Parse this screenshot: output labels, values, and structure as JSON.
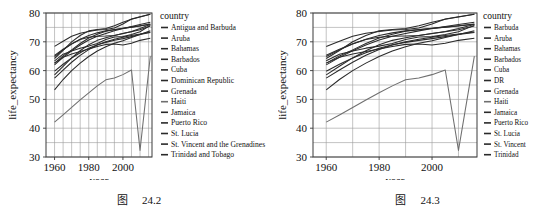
{
  "page": {
    "background": "#ffffff",
    "line_color": "#2a2a2a",
    "haiti_color": "#6f6f6f",
    "grid_color": "#9a9a9a"
  },
  "figures": [
    {
      "id": "figure-24-2",
      "caption_prefix": "图",
      "caption_number": "24.2",
      "legend_title": "country",
      "chart_data": {
        "type": "line",
        "title": "",
        "xlabel": "year",
        "ylabel": "life_expectancy",
        "xlim": [
          1955,
          2017
        ],
        "ylim": [
          30,
          80
        ],
        "xticks": [
          1960,
          1980,
          2000
        ],
        "yticks": [
          30,
          40,
          50,
          60,
          70,
          80
        ],
        "grid": true,
        "legend_position": "right",
        "x": [
          1960,
          1965,
          1970,
          1975,
          1980,
          1985,
          1990,
          1995,
          2000,
          2005,
          2010,
          2016
        ],
        "series": [
          {
            "name": "Antigua and Barbuda",
            "values": [
              62.0,
              64.6,
              66.9,
              68.9,
              70.6,
              71.9,
              72.9,
              73.8,
              74.6,
              75.3,
              76.0,
              76.8
            ]
          },
          {
            "name": "Aruba",
            "values": [
              64.9,
              67.2,
              69.2,
              70.9,
              72.2,
              73.1,
              73.8,
              74.3,
              74.7,
              75.1,
              75.5,
              76.1
            ]
          },
          {
            "name": "Bahamas",
            "values": [
              63.4,
              65.7,
              66.8,
              67.8,
              68.5,
              69.4,
              70.8,
              71.7,
              71.8,
              72.5,
              73.5,
              75.7
            ]
          },
          {
            "name": "Barbados",
            "values": [
              62.6,
              65.1,
              67.2,
              69.4,
              71.3,
              72.6,
              73.7,
              74.2,
              74.6,
              75.1,
              75.6,
              76.2
            ]
          },
          {
            "name": "Cuba",
            "values": [
              64.2,
              67.0,
              70.0,
              72.2,
              73.8,
              74.3,
              74.6,
              75.6,
              76.8,
              77.8,
              78.6,
              79.6
            ]
          },
          {
            "name": "Dominican Republic",
            "values": [
              53.3,
              56.9,
              60.0,
              62.6,
              64.9,
              66.8,
              68.3,
              69.5,
              70.4,
              71.5,
              72.5,
              73.8
            ]
          },
          {
            "name": "Grenada",
            "values": [
              57.4,
              60.2,
              62.9,
              65.3,
              67.3,
              68.9,
              70.0,
              70.9,
              71.6,
              72.2,
              72.7,
              73.4
            ]
          },
          {
            "name": "Haiti",
            "values": [
              42.1,
              44.6,
              47.2,
              49.8,
              52.3,
              54.7,
              56.8,
              57.4,
              58.6,
              60.2,
              32.3,
              65.0
            ]
          },
          {
            "name": "Jamaica",
            "values": [
              65.3,
              67.4,
              69.3,
              70.8,
              71.6,
              71.9,
              72.0,
              72.2,
              72.9,
              73.6,
              74.6,
              76.0
            ]
          },
          {
            "name": "Puerto Rico",
            "values": [
              68.4,
              70.2,
              71.9,
              73.0,
              73.6,
              74.1,
              74.3,
              74.8,
              76.2,
              77.9,
              78.7,
              79.6
            ]
          },
          {
            "name": "St. Lucia",
            "values": [
              58.5,
              61.5,
              64.4,
              66.9,
              69.0,
              70.5,
              71.4,
              72.2,
              72.9,
              73.5,
              74.2,
              75.5
            ]
          },
          {
            "name": "St. Vincent and the Grenadines",
            "values": [
              59.8,
              62.2,
              64.4,
              66.2,
              67.8,
              69.0,
              69.8,
              70.5,
              71.1,
              71.8,
              72.5,
              73.2
            ]
          },
          {
            "name": "Trinidad and Tobago",
            "values": [
              62.6,
              64.6,
              65.8,
              66.6,
              67.5,
              68.4,
              69.1,
              69.2,
              68.9,
              69.5,
              70.5,
              71.2
            ]
          }
        ]
      }
    },
    {
      "id": "figure-24-3",
      "caption_prefix": "图",
      "caption_number": "24.3",
      "legend_title": "country",
      "chart_data": {
        "type": "line",
        "title": "",
        "xlabel": "year",
        "ylabel": "life_expectancy",
        "xlim": [
          1955,
          2017
        ],
        "ylim": [
          30,
          80
        ],
        "xticks": [
          1960,
          1980,
          2000
        ],
        "yticks": [
          30,
          40,
          50,
          60,
          70,
          80
        ],
        "grid": true,
        "legend_position": "right",
        "x": [
          1960,
          1965,
          1970,
          1975,
          1980,
          1985,
          1990,
          1995,
          2000,
          2005,
          2010,
          2016
        ],
        "series": [
          {
            "name": "Barbuda",
            "values": [
              62.0,
              64.6,
              66.9,
              68.9,
              70.6,
              71.9,
              72.9,
              73.8,
              74.6,
              75.3,
              76.0,
              76.8
            ]
          },
          {
            "name": "Aruba",
            "values": [
              64.9,
              67.2,
              69.2,
              70.9,
              72.2,
              73.1,
              73.8,
              74.3,
              74.7,
              75.1,
              75.5,
              76.1
            ]
          },
          {
            "name": "Bahamas",
            "values": [
              63.4,
              65.7,
              66.8,
              67.8,
              68.5,
              69.4,
              70.8,
              71.7,
              71.8,
              72.5,
              73.5,
              75.7
            ]
          },
          {
            "name": "Barbados",
            "values": [
              62.6,
              65.1,
              67.2,
              69.4,
              71.3,
              72.6,
              73.7,
              74.2,
              74.6,
              75.1,
              75.6,
              76.2
            ]
          },
          {
            "name": "Cuba",
            "values": [
              64.2,
              67.0,
              70.0,
              72.2,
              73.8,
              74.3,
              74.6,
              75.6,
              76.8,
              77.8,
              78.6,
              79.6
            ]
          },
          {
            "name": "DR",
            "values": [
              53.3,
              56.9,
              60.0,
              62.6,
              64.9,
              66.8,
              68.3,
              69.5,
              70.4,
              71.5,
              72.5,
              73.8
            ]
          },
          {
            "name": "Grenada",
            "values": [
              57.4,
              60.2,
              62.9,
              65.3,
              67.3,
              68.9,
              70.0,
              70.9,
              71.6,
              72.2,
              72.7,
              73.4
            ]
          },
          {
            "name": "Haiti",
            "values": [
              42.1,
              44.6,
              47.2,
              49.8,
              52.3,
              54.7,
              56.8,
              57.4,
              58.6,
              60.2,
              32.3,
              65.0
            ]
          },
          {
            "name": "Jamaica",
            "values": [
              65.3,
              67.4,
              69.3,
              70.8,
              71.6,
              71.9,
              72.0,
              72.2,
              72.9,
              73.6,
              74.6,
              76.0
            ]
          },
          {
            "name": "Puerto Rico",
            "values": [
              68.4,
              70.2,
              71.9,
              73.0,
              73.6,
              74.1,
              74.3,
              74.8,
              76.2,
              77.9,
              78.7,
              79.6
            ]
          },
          {
            "name": "St. Lucia",
            "values": [
              58.5,
              61.5,
              64.4,
              66.9,
              69.0,
              70.5,
              71.4,
              72.2,
              72.9,
              73.5,
              74.2,
              75.5
            ]
          },
          {
            "name": "St. Vincent",
            "values": [
              59.8,
              62.2,
              64.4,
              66.2,
              67.8,
              69.0,
              69.8,
              70.5,
              71.1,
              71.8,
              72.5,
              73.2
            ]
          },
          {
            "name": "Trinidad",
            "values": [
              62.6,
              64.6,
              65.8,
              66.6,
              67.5,
              68.4,
              69.1,
              69.2,
              68.9,
              69.5,
              70.5,
              71.2
            ]
          }
        ]
      }
    }
  ]
}
